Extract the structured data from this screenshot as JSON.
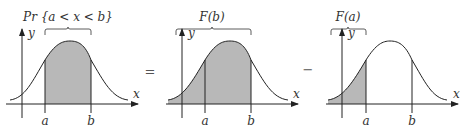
{
  "equation": {
    "operators": [
      "=",
      "−"
    ]
  },
  "panels": [
    {
      "id": "probability-interval",
      "title": "Pr {a < x < b}",
      "axis_x": "x",
      "axis_y": "y",
      "tick_a": "a",
      "tick_b": "b",
      "shaded": "between a and b"
    },
    {
      "id": "cdf-b",
      "title": "F(b)",
      "axis_x": "x",
      "axis_y": "y",
      "tick_a": "a",
      "tick_b": "b",
      "shaded": "left of b"
    },
    {
      "id": "cdf-a",
      "title": "F(a)",
      "axis_x": "x",
      "axis_y": "y",
      "tick_a": "a",
      "tick_b": "b",
      "shaded": "left of a"
    }
  ],
  "colors": {
    "shade": "#b8b8b8",
    "line": "#222222"
  }
}
